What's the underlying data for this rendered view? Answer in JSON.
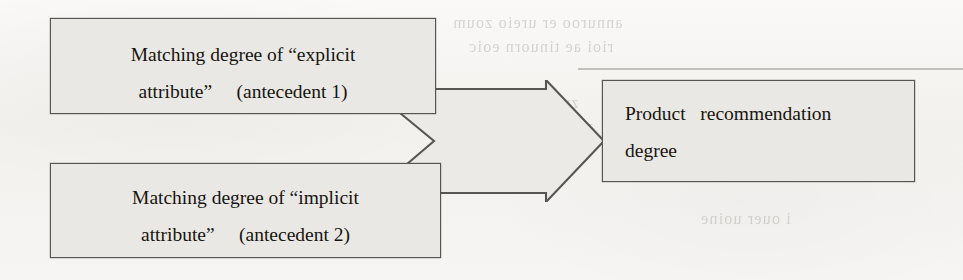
{
  "diagram": {
    "background_color": "#f4f3f1",
    "node_fill_color": "#e9e8e5",
    "node_border_color": "#585654",
    "text_color": "#17150f",
    "nodes": [
      {
        "id": "explicit",
        "name": "antecedent-1",
        "line1": "Matching degree of “explicit",
        "line2": "attribute”     (antecedent 1)"
      },
      {
        "id": "implicit",
        "name": "antecedent-2",
        "line1": "Matching degree of “implicit",
        "line2": "attribute”     (antecedent 2)"
      },
      {
        "id": "output",
        "name": "consequent",
        "line1": "Product   recommendation",
        "line2": "degree"
      }
    ],
    "connector": {
      "name": "merge-arrow",
      "shape": "merging-block-arrow",
      "direction": "left-to-right",
      "from": [
        "antecedent-1",
        "antecedent-2"
      ],
      "to": "consequent"
    },
    "bleed_through": [
      {
        "text": "annuroo er ureio zoum",
        "x": 452,
        "y": 14,
        "size": 16
      },
      {
        "text": "rioi ae tinuorn eoic",
        "x": 468,
        "y": 38,
        "size": 16
      },
      {
        "text": "zuoim ea ar ouio",
        "x": 452,
        "y": 94,
        "size": 16
      },
      {
        "text": "anu zuoims erun",
        "x": 470,
        "y": 118,
        "size": 16
      },
      {
        "text": "Seour unruies eure",
        "x": 660,
        "y": 142,
        "size": 19
      },
      {
        "text": "i ouer uoine",
        "x": 700,
        "y": 210,
        "size": 16
      }
    ]
  }
}
